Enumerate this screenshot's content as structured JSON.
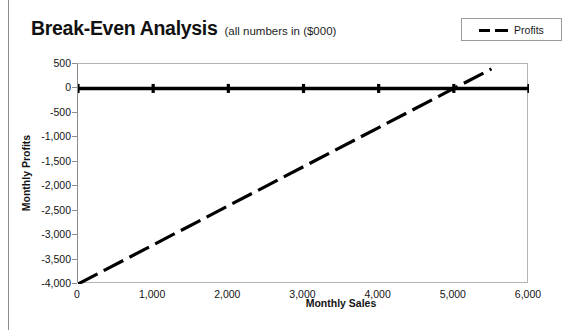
{
  "chart_data": {
    "type": "line",
    "title": "Break-Even Analysis",
    "subtitle": "(all numbers in ($000)",
    "xlabel": "Monthly Sales",
    "ylabel": "Monthly Profits",
    "xlim": [
      0,
      6000
    ],
    "ylim": [
      -4000,
      500
    ],
    "xticks": [
      "0",
      "1,000",
      "2,000",
      "3,000",
      "4,000",
      "5,000",
      "6,000"
    ],
    "xtick_values": [
      0,
      1000,
      2000,
      3000,
      4000,
      5000,
      6000
    ],
    "yticks": [
      "500",
      "0",
      "-500",
      "-1,000",
      "-1,500",
      "-2,000",
      "-2,500",
      "-3,000",
      "-3,500",
      "-4,000"
    ],
    "ytick_values": [
      500,
      0,
      -500,
      -1000,
      -1500,
      -2000,
      -2500,
      -3000,
      -3500,
      -4000
    ],
    "grid": false,
    "legend": {
      "position": "top-right",
      "entries": [
        {
          "label": "Profits",
          "style": "dashed",
          "color": "#000000"
        }
      ]
    },
    "series": [
      {
        "name": "Zero Line",
        "style": "solid",
        "color": "#000000",
        "markers": true,
        "x": [
          0,
          1000,
          2000,
          3000,
          4000,
          5000,
          6000
        ],
        "values": [
          0,
          0,
          0,
          0,
          0,
          0,
          0
        ]
      },
      {
        "name": "Profits",
        "style": "dashed",
        "color": "#000000",
        "markers": false,
        "x": [
          0,
          1000,
          2000,
          3000,
          4000,
          5000,
          5500
        ],
        "values": [
          -4000,
          -3200,
          -2400,
          -1600,
          -800,
          0,
          400
        ]
      }
    ],
    "breakeven_point": {
      "x": 5000,
      "y": 0
    }
  }
}
